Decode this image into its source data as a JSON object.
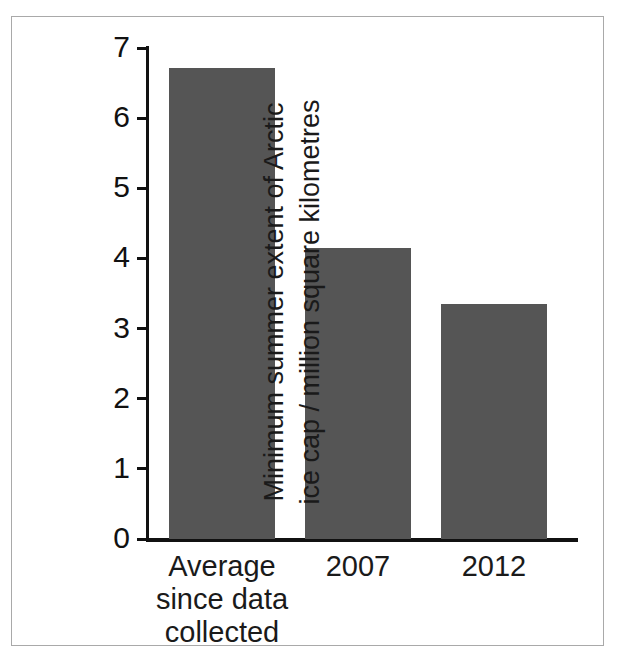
{
  "chart_data": {
    "type": "bar",
    "title": "",
    "subtitle": "",
    "xlabel": "",
    "ylabel": "Minimum summer extent of Arctic ice cap / million square kilometres",
    "ylabel_lines": [
      "Minimum summer extent of Arctic",
      "ice cap / million square kilometres"
    ],
    "categories": [
      "Average\nsince data\ncollected",
      "2007",
      "2012"
    ],
    "category_labels_flat": [
      "Average since data collected",
      "2007",
      "2012"
    ],
    "values": [
      6.72,
      4.15,
      3.35
    ],
    "ylim": [
      0,
      7
    ],
    "yticks": [
      0,
      1,
      2,
      3,
      4,
      5,
      6,
      7
    ],
    "ytick_labels": [
      "0",
      "1",
      "2",
      "3",
      "4",
      "5",
      "6",
      "7"
    ],
    "grid": false,
    "legend": false,
    "legend_position": "none",
    "bar_color": "#555555",
    "axis_color": "#111111",
    "background_color": "#ffffff",
    "frame_border_color": "#a9a9a9",
    "text_color": "#1a1a1a"
  }
}
